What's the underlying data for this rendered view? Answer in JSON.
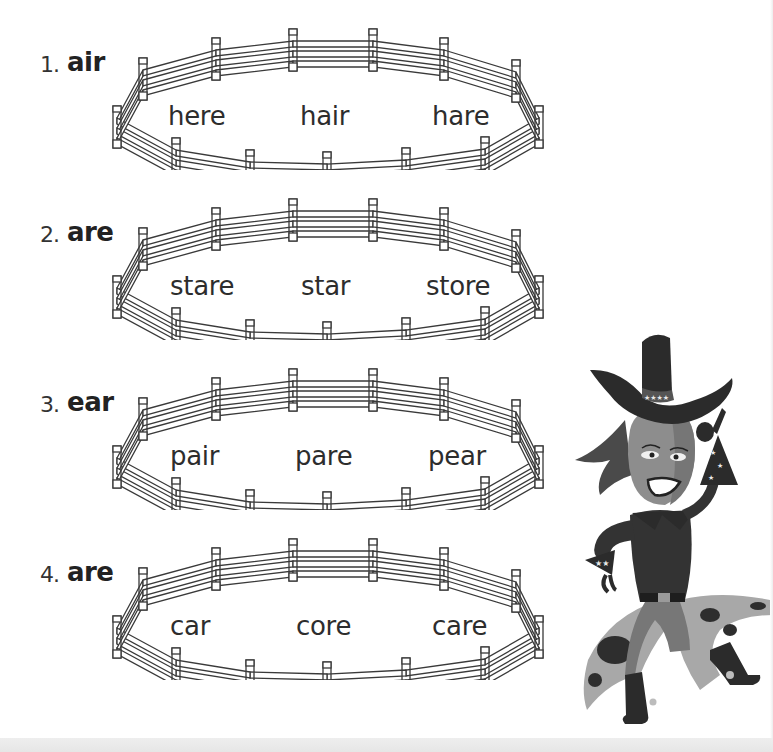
{
  "worksheet": {
    "exercises": [
      {
        "number": "1.",
        "pattern": "air",
        "words": [
          "here",
          "hair",
          "hare"
        ]
      },
      {
        "number": "2.",
        "pattern": "are",
        "words": [
          "stare",
          "star",
          "store"
        ]
      },
      {
        "number": "3.",
        "pattern": "ear",
        "words": [
          "pair",
          "pare",
          "pear"
        ]
      },
      {
        "number": "4.",
        "pattern": "are",
        "words": [
          "car",
          "core",
          "care"
        ]
      }
    ]
  },
  "illustration": {
    "subject": "cowgirl-character",
    "colors": {
      "hat": "#2b2b2b",
      "skin_light": "#8d8d8d",
      "skin_dark": "#707070",
      "hair": "#4a4a4a",
      "chaps": "#a8a8a8",
      "spots": "#2e2e2e",
      "star": "#e8e8e8"
    }
  },
  "colors": {
    "background": "#ffffff",
    "ink": "#2a2a2a",
    "fence_stroke": "#3a3a3a",
    "fence_fill": "#ffffff",
    "bottom_band": "#e9e9e9"
  }
}
